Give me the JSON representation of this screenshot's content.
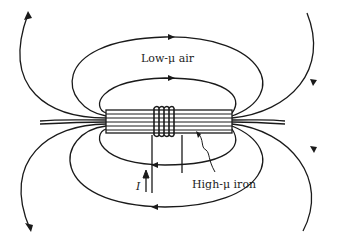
{
  "diagram": {
    "labels": {
      "air": "Low-μ air",
      "iron": "High-μ iron",
      "current": "I"
    },
    "elements": {
      "core": "rectangular iron bar with horizontal laminations",
      "coil": "winding of 5 turns around core center",
      "field_lines_above": 3,
      "field_lines_below": 3,
      "field_direction_top": "left-to-right",
      "field_direction_bottom": "right-to-left"
    },
    "colors": {
      "line": "#1a1a1a",
      "background": "#ffffff"
    }
  }
}
